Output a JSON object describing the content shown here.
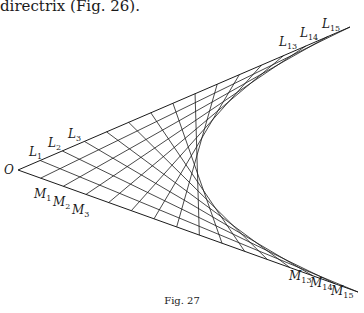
{
  "text": {
    "top_line": "directrix (Fig. 26).",
    "caption": "Fig. 27"
  },
  "diagram": {
    "type": "parabola-envelope-line-construction",
    "vertex_label": "O",
    "upper_line_points": [
      "L1",
      "L2",
      "L3",
      "L13",
      "L14",
      "L15"
    ],
    "lower_line_points": [
      "M1",
      "M2",
      "M3",
      "M13",
      "M14",
      "M15"
    ],
    "divisions": 15,
    "connection_rule": "L_i joined to M_(16-i)",
    "line_color": "#1a1a1a"
  }
}
